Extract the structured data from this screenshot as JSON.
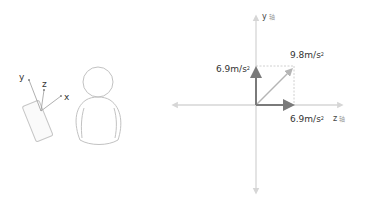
{
  "illustration": {
    "phone_axes": {
      "x": "x",
      "y": "y",
      "z": "z"
    },
    "person": "person-silhouette"
  },
  "diagram": {
    "vertical_axis_label": "y",
    "horizontal_axis_label": "z",
    "axis_suffix_glyph": "轴",
    "vector_y": {
      "value": "6.9",
      "unit": "m/s",
      "exp": "2"
    },
    "vector_z": {
      "value": "6.9",
      "unit": "m/s",
      "exp": "2"
    },
    "vector_resultant": {
      "value": "9.8",
      "unit": "m/s",
      "exp": "2"
    }
  },
  "colors": {
    "axis": "#d6d6d6",
    "component_vector": "#7a7a7a",
    "resultant_vector": "#b5b5b5",
    "dashed_guide": "#c4c4c4",
    "outline": "#bdbdbd",
    "text": "#333333"
  }
}
